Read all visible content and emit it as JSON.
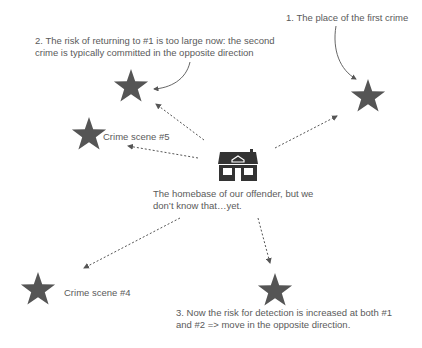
{
  "diagram": {
    "colors": {
      "star": "#555555",
      "house": "#333333",
      "text": "#5a5a5a",
      "arrow": "#555555"
    },
    "annotations": {
      "first_crime": "1. The place of the first crime",
      "second_crime_line1": "2. The risk of returning to #1 is too large now: the second",
      "second_crime_line2": "crime is typically committed in the opposite direction",
      "third_crime_line1": "3. Now the risk for detection is increased at both #1",
      "third_crime_line2": "and #2 => move in the opposite direction.",
      "homebase_line1": "The homebase of our offender, but we",
      "homebase_line2": "don’t know that…yet.",
      "scene5": "Crime scene #5",
      "scene4": "Crime scene #4"
    },
    "nodes": [
      {
        "id": "crime1",
        "icon": "star-icon",
        "x": 368,
        "y": 97
      },
      {
        "id": "crime2",
        "icon": "star-icon",
        "x": 131,
        "y": 87
      },
      {
        "id": "crime3",
        "icon": "star-icon",
        "x": 275,
        "y": 289
      },
      {
        "id": "crime4",
        "icon": "star-icon",
        "x": 39,
        "y": 289
      },
      {
        "id": "crime5",
        "icon": "star-icon",
        "x": 90,
        "y": 134
      },
      {
        "id": "homebase",
        "icon": "house-icon",
        "x": 237,
        "y": 162
      }
    ]
  }
}
